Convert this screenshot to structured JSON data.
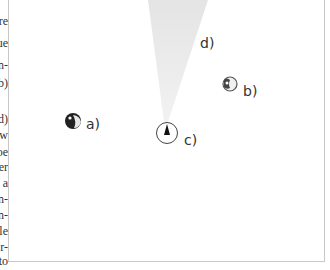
{
  "margin_fragments": [
    "re",
    "ue",
    "n-",
    "b)",
    "d)",
    "w",
    "oe",
    "er",
    "a",
    "n-",
    "n-",
    "le",
    "r-",
    "to"
  ],
  "figure": {
    "labels": {
      "a": "a)",
      "b": "b)",
      "c": "c)",
      "d": "d)"
    },
    "objects": [
      {
        "id": "a",
        "kind": "dark-blob"
      },
      {
        "id": "b",
        "kind": "light-blob"
      },
      {
        "id": "c",
        "kind": "circle-with-pointer"
      },
      {
        "id": "d",
        "kind": "view-cone"
      }
    ]
  }
}
